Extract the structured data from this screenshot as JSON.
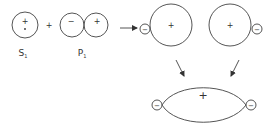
{
  "diagram": {
    "type": "orbital-hybridization",
    "colors": {
      "line": "#555555",
      "text": "#333333",
      "background": "#ffffff"
    },
    "s_orbital": {
      "label": "S",
      "subscript": "1",
      "sign": "+"
    },
    "plus_operator": "+",
    "p_orbital": {
      "label": "P",
      "subscript": "1",
      "left_lobe_sign": "−",
      "right_lobe_sign": "+"
    },
    "hybrid_orbitals": [
      {
        "large_lobe_sign": "+",
        "small_lobe_sign": "−",
        "small_lobe_side": "left"
      },
      {
        "large_lobe_sign": "+",
        "small_lobe_sign": "−",
        "small_lobe_side": "right"
      }
    ],
    "combined_orbital": {
      "center_sign": "+",
      "left_small_lobe_sign": "−",
      "right_small_lobe_sign": "−"
    }
  }
}
